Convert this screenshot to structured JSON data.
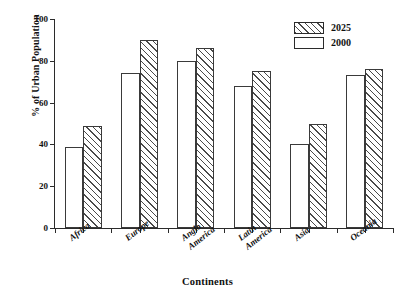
{
  "chart_data": {
    "type": "bar",
    "title": "",
    "xlabel": "Continents",
    "ylabel": "% of Urban Population",
    "ylim": [
      0,
      100
    ],
    "yticks": [
      0,
      20,
      40,
      60,
      80,
      100
    ],
    "grid": false,
    "legend_position": "top-right",
    "categories": [
      "Africa",
      "Europe",
      "Anglo\nAmerica",
      "Latin\nAmerica",
      "Asia",
      "Oceania"
    ],
    "series": [
      {
        "name": "2000",
        "style": "plain",
        "values": [
          39,
          74,
          80,
          68,
          40,
          73
        ]
      },
      {
        "name": "2025",
        "style": "hatched",
        "values": [
          49,
          90,
          86,
          75,
          50,
          76
        ]
      }
    ]
  },
  "legend": {
    "items": [
      {
        "label": "2025",
        "style": "hatched"
      },
      {
        "label": "2000",
        "style": "plain"
      }
    ]
  },
  "colors": {
    "axis": "#2b2b2b",
    "bar_edge": "#3a3a3a",
    "hatch": "#4a4a4a",
    "background": "#ffffff"
  }
}
